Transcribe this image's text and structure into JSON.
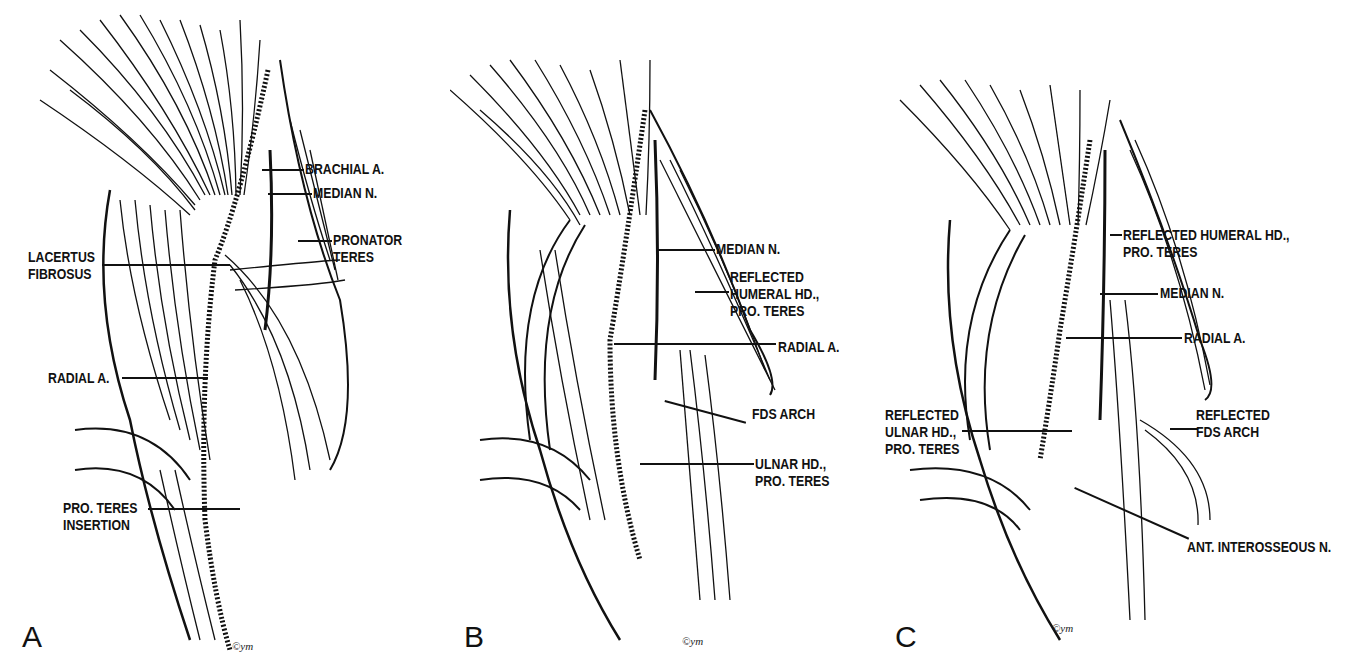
{
  "figure": {
    "panels": [
      {
        "letter": "A",
        "signature": "©ym",
        "labels": [
          {
            "text": "BRACHIAL A."
          },
          {
            "text": "MEDIAN N."
          },
          {
            "text": "PRONATOR\nTERES"
          },
          {
            "text": "LACERTUS\nFIBROSUS"
          },
          {
            "text": "RADIAL A."
          },
          {
            "text": "PRO. TERES\nINSERTION"
          }
        ]
      },
      {
        "letter": "B",
        "signature": "©ym",
        "labels": [
          {
            "text": "MEDIAN N."
          },
          {
            "text": "REFLECTED\nHUMERAL HD.,\nPRO. TERES"
          },
          {
            "text": "RADIAL A."
          },
          {
            "text": "FDS ARCH"
          },
          {
            "text": "ULNAR HD.,\nPRO. TERES"
          }
        ]
      },
      {
        "letter": "C",
        "signature": "©ym",
        "labels": [
          {
            "text": "REFLECTED HUMERAL HD.,\nPRO. TERES"
          },
          {
            "text": "MEDIAN N."
          },
          {
            "text": "RADIAL A."
          },
          {
            "text": "REFLECTED\nULNAR HD.,\nPRO. TERES"
          },
          {
            "text": "REFLECTED\nFDS ARCH"
          },
          {
            "text": "ANT. INTEROSSEOUS N."
          }
        ]
      }
    ]
  }
}
